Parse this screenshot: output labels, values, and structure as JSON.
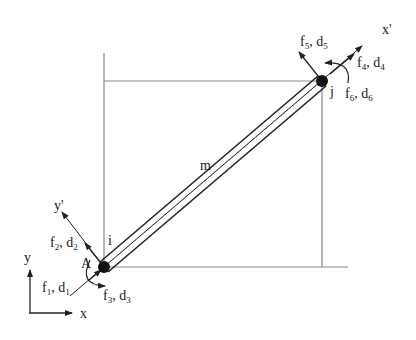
{
  "diagram": {
    "type": "frame-element-diagram",
    "member_label": "m",
    "nodes": {
      "start": {
        "label": "i",
        "x": 104,
        "y": 267
      },
      "end": {
        "label": "j",
        "x": 322,
        "y": 81
      }
    },
    "point_label": "A",
    "global_axes": {
      "x": "x",
      "y": "y"
    },
    "local_axes": {
      "x": "x'",
      "y": "y'"
    },
    "dofs_start": [
      {
        "f": "f",
        "f_sub": "1",
        "d": "d",
        "d_sub": "1"
      },
      {
        "f": "f",
        "f_sub": "2",
        "d": "d",
        "d_sub": "2"
      },
      {
        "f": "f",
        "f_sub": "3",
        "d": "d",
        "d_sub": "3"
      }
    ],
    "dofs_end": [
      {
        "f": "f",
        "f_sub": "4",
        "d": "d",
        "d_sub": "4"
      },
      {
        "f": "f",
        "f_sub": "5",
        "d": "d",
        "d_sub": "5"
      },
      {
        "f": "f",
        "f_sub": "6",
        "d": "d",
        "d_sub": "6"
      }
    ],
    "colors": {
      "line": "#222222",
      "guide": "#888888",
      "node": "#111111"
    }
  }
}
